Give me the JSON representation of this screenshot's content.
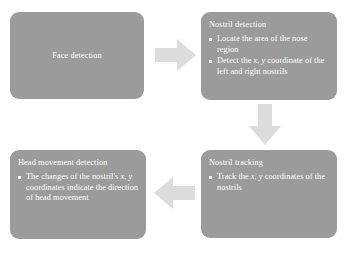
{
  "diagram": {
    "type": "flowchart",
    "background_color": "#ffffff",
    "node_fill_color": "#9b9b9b",
    "node_text_color": "#ffffff",
    "arrow_color": "#dcdcdc",
    "nodes": [
      {
        "id": "face-detection",
        "title": "Face detection",
        "bullets": []
      },
      {
        "id": "nostril-detection",
        "title": "Nostril detection",
        "bullets": [
          "Locate the area of the nose region",
          "Detect the x, y coordinate of the left and right nostrils"
        ]
      },
      {
        "id": "nostril-tracking",
        "title": "Nostril tracking",
        "bullets": [
          "Track the x, y coordinates of the nostrils"
        ]
      },
      {
        "id": "head-movement-detection",
        "title": "Head movement detection",
        "bullets": [
          "The changes of the nostril's x, y coordinates indicate the direction of head movement"
        ]
      }
    ],
    "arrows": [
      {
        "id": "face-to-nostril-detection",
        "direction": "right"
      },
      {
        "id": "nostril-detection-to-tracking",
        "direction": "down"
      },
      {
        "id": "tracking-to-head-movement",
        "direction": "left"
      }
    ]
  }
}
